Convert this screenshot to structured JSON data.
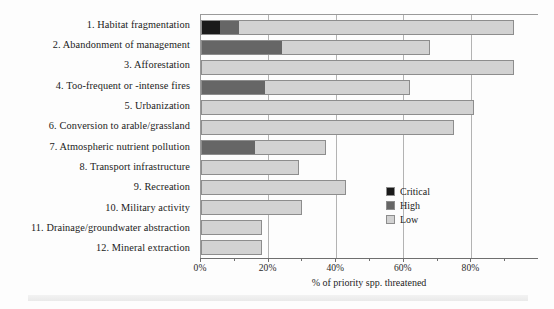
{
  "chart_data": {
    "type": "bar",
    "orientation": "horizontal",
    "stacked": true,
    "title": "",
    "xlabel": "% of priority spp. threatened",
    "ylabel": "",
    "xlim": [
      0,
      100
    ],
    "grid": true,
    "legend_position": "inside-right",
    "categories": [
      "1. Habitat fragmentation",
      "2. Abandonment of management",
      "3. Afforestation",
      "4. Too-frequent or -intense fires",
      "5. Urbanization",
      "6. Conversion to arable/grassland",
      "7. Atmospheric nutrient pollution",
      "8. Transport infrastructure",
      "9. Recreation",
      "10. Military activity",
      "11. Drainage/groundwater abstraction",
      "12. Mineral extraction"
    ],
    "series": [
      {
        "name": "Critical",
        "color": "#1a1a1a",
        "values": [
          5.5,
          0,
          0,
          0,
          0,
          0,
          0,
          0,
          0,
          0,
          0,
          0
        ]
      },
      {
        "name": "High",
        "color": "#666666",
        "values": [
          5.5,
          24,
          0,
          19,
          0,
          0,
          16,
          0,
          0,
          0,
          0,
          0
        ]
      },
      {
        "name": "Low",
        "color": "#d2d2d2",
        "values": [
          82,
          44,
          93,
          43,
          81,
          75,
          21,
          29,
          43,
          30,
          18,
          18
        ]
      }
    ],
    "totals": [
      93,
      68,
      93,
      62,
      81,
      75,
      37,
      29,
      43,
      30,
      18,
      18
    ],
    "xticks": [
      {
        "value": 0,
        "label": "0%",
        "minor": false
      },
      {
        "value": 10,
        "label": "",
        "minor": true
      },
      {
        "value": 20,
        "label": "20%",
        "minor": false
      },
      {
        "value": 30,
        "label": "",
        "minor": true
      },
      {
        "value": 40,
        "label": "40%",
        "minor": false
      },
      {
        "value": 50,
        "label": "",
        "minor": true
      },
      {
        "value": 60,
        "label": "60%",
        "minor": false
      },
      {
        "value": 70,
        "label": "",
        "minor": true
      },
      {
        "value": 80,
        "label": "80%",
        "minor": false
      },
      {
        "value": 90,
        "label": "",
        "minor": true
      }
    ],
    "gridline_values": [
      20,
      40,
      60,
      80
    ]
  },
  "legend": {
    "items": [
      {
        "label": "Critical",
        "color": "#1a1a1a"
      },
      {
        "label": "High",
        "color": "#666666"
      },
      {
        "label": "Low",
        "color": "#d2d2d2"
      }
    ]
  }
}
